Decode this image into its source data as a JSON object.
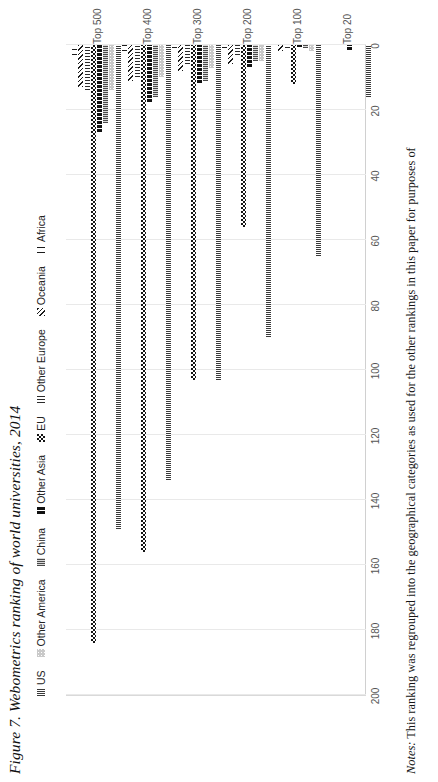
{
  "figure": {
    "title": "Figure 7. Webometrics ranking of world universities, 2014",
    "notes_label": "Notes:",
    "notes_text": " This ranking was regrouped into the geographical categories as used for the other rankings in this paper for purposes of"
  },
  "chart_data": {
    "type": "bar",
    "orientation": "horizontal",
    "title": "Figure 7. Webometrics ranking of world universities, 2014",
    "xlabel": "",
    "ylabel": "",
    "xlim": [
      0,
      200
    ],
    "xticks": [
      0,
      20,
      40,
      60,
      80,
      100,
      120,
      140,
      160,
      180,
      200
    ],
    "grid": true,
    "legend_position": "top",
    "categories": [
      "Top 20",
      "Top 100",
      "Top 200",
      "Top 300",
      "Top 400",
      "Top 500"
    ],
    "series": [
      {
        "name": "US",
        "pattern": "vertical-stripes-fine",
        "values": [
          16,
          65,
          90,
          103,
          134,
          149
        ]
      },
      {
        "name": "Other America",
        "pattern": "light-dotted",
        "values": [
          0,
          2,
          5,
          7,
          10,
          14
        ]
      },
      {
        "name": "China",
        "pattern": "vertical-stripes-dense",
        "values": [
          0,
          1,
          5,
          11,
          16,
          24
        ]
      },
      {
        "name": "Other Asia",
        "pattern": "solid-black-dashed",
        "values": [
          2,
          1,
          7,
          12,
          18,
          27
        ]
      },
      {
        "name": "EU",
        "pattern": "checkerboard",
        "values": [
          0,
          12,
          56,
          103,
          156,
          184
        ]
      },
      {
        "name": "Other Europe",
        "pattern": "vertical-bars",
        "values": [
          0,
          1,
          3,
          6,
          10,
          14
        ]
      },
      {
        "name": "Oceania",
        "pattern": "diagonal-stripes",
        "values": [
          0,
          2,
          6,
          8,
          11,
          13
        ]
      },
      {
        "name": "Africa",
        "pattern": "sparse-stripes",
        "values": [
          0,
          0,
          1,
          1,
          2,
          3
        ]
      }
    ]
  }
}
